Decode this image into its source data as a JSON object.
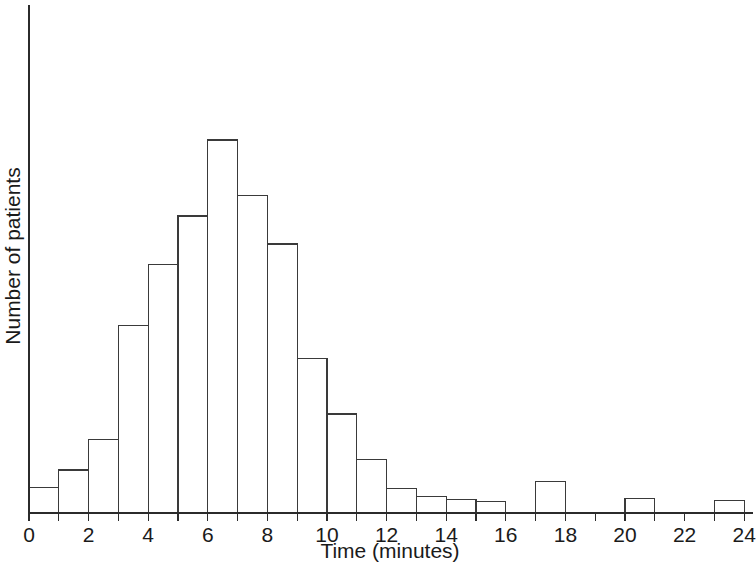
{
  "chart_data": {
    "type": "bar",
    "title": "",
    "subtitle": "",
    "xlabel": "Time (minutes)",
    "ylabel": "Number of patients",
    "grid": false,
    "legend": false,
    "legend_position": "none",
    "bin_width": 1,
    "xlim": [
      0,
      24.5
    ],
    "ylim": [
      0,
      100
    ],
    "xticks": [
      0,
      2,
      4,
      6,
      8,
      10,
      12,
      14,
      16,
      18,
      20,
      22,
      24
    ],
    "xtick_labels": [
      "0",
      "2",
      "4",
      "6",
      "8",
      "10",
      "12",
      "14",
      "16",
      "18",
      "20",
      "22",
      "24"
    ],
    "yticks": [],
    "ytick_labels": [],
    "y_axis_units": "relative (unlabeled)",
    "categories": [
      "0-1",
      "1-2",
      "2-3",
      "3-4",
      "4-5",
      "5-6",
      "6-7",
      "7-8",
      "8-9",
      "9-10",
      "10-11",
      "11-12",
      "12-13",
      "13-14",
      "14-15",
      "15-16",
      "16-17",
      "17-18",
      "18-19",
      "19-20",
      "20-21",
      "21-22",
      "22-23",
      "23-24"
    ],
    "bin_starts": [
      0,
      1,
      2,
      3,
      4,
      5,
      6,
      7,
      8,
      9,
      10,
      11,
      12,
      13,
      14,
      15,
      16,
      17,
      18,
      19,
      20,
      21,
      22,
      23
    ],
    "values": [
      5,
      8.5,
      14.5,
      37,
      49,
      58.5,
      73.5,
      62.5,
      53,
      30.5,
      19.5,
      10.5,
      4.8,
      3.3,
      2.7,
      2.2,
      0,
      6.2,
      0,
      0,
      2.9,
      0,
      0,
      2.5
    ]
  },
  "axis": {
    "x_label": "Time (minutes)",
    "y_label": "Number of patients"
  }
}
